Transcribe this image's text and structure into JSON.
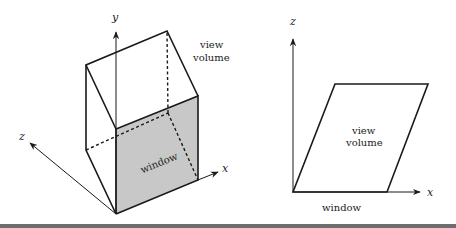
{
  "figure": {
    "left_diagram": {
      "axes": {
        "x_label": "x",
        "y_label": "y",
        "z_label": "z"
      },
      "labels": {
        "volume": [
          "view",
          "volume"
        ],
        "window": "window"
      },
      "colors": {
        "window_fill": "#c8c8c8",
        "stroke": "#1a1a1a"
      }
    },
    "right_diagram": {
      "axes": {
        "x_label": "x",
        "z_label": "z"
      },
      "labels": {
        "volume": [
          "view",
          "volume"
        ],
        "window": "window"
      },
      "colors": {
        "stroke": "#1a1a1a"
      }
    },
    "rule_color": "#6e6e6e"
  }
}
